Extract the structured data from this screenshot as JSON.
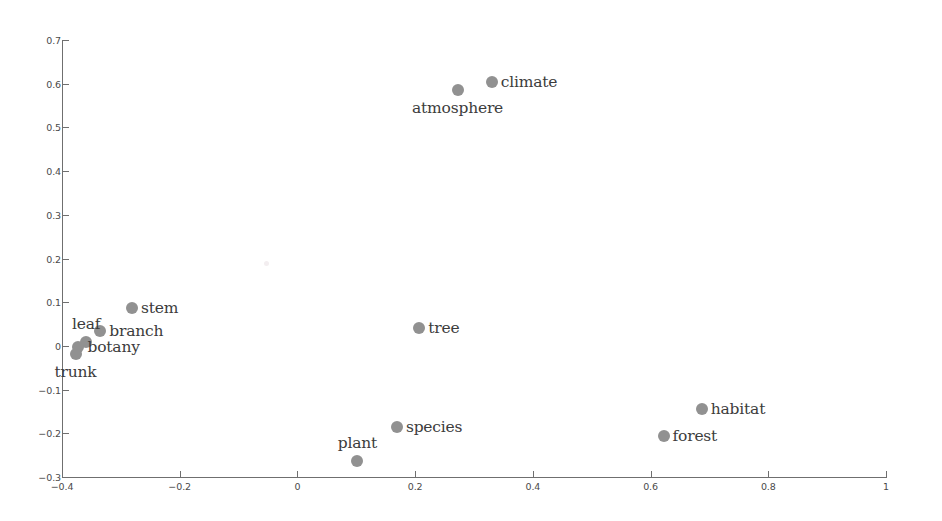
{
  "chart_data": {
    "type": "scatter",
    "title": "",
    "subtitle": "",
    "xlabel": "",
    "ylabel": "",
    "xlim": [
      -0.4,
      1.0
    ],
    "ylim": [
      -0.3,
      0.7
    ],
    "xticks": [
      -0.4,
      -0.2,
      0,
      0.2,
      0.4,
      0.6,
      0.8,
      1
    ],
    "yticks": [
      -0.3,
      -0.2,
      -0.1,
      0,
      0.1,
      0.2,
      0.3,
      0.4,
      0.5,
      0.6,
      0.7
    ],
    "xticklabels": [
      "−0.4",
      "−0.2",
      "0",
      "0.2",
      "0.4",
      "0.6",
      "0.8",
      "1"
    ],
    "yticklabels": [
      "−0.3",
      "−0.2",
      "−0.1",
      "0",
      "0.1",
      "0.2",
      "0.3",
      "0.4",
      "0.5",
      "0.6",
      "0.7"
    ],
    "grid": false,
    "legend": null,
    "marker_color": "#919191",
    "marker_size": 12,
    "axis_color": "#6f6f6f",
    "background_color": "#ffffff",
    "points": [
      {
        "label": "climate",
        "x": 0.33,
        "y": 0.605,
        "label_pos": "right"
      },
      {
        "label": "atmosphere",
        "x": 0.272,
        "y": 0.585,
        "label_pos": "below"
      },
      {
        "label": "stem",
        "x": -0.281,
        "y": 0.086,
        "label_pos": "right"
      },
      {
        "label": "branch",
        "x": -0.335,
        "y": 0.033,
        "label_pos": "right"
      },
      {
        "label": "leaf",
        "x": -0.359,
        "y": 0.01,
        "label_pos": "above"
      },
      {
        "label": "botany",
        "x": -0.372,
        "y": -0.002,
        "label_pos": "right"
      },
      {
        "label": "trunk",
        "x": -0.377,
        "y": -0.018,
        "label_pos": "below"
      },
      {
        "label": "tree",
        "x": 0.207,
        "y": 0.041,
        "label_pos": "right"
      },
      {
        "label": "species",
        "x": 0.169,
        "y": -0.186,
        "label_pos": "right"
      },
      {
        "label": "plant",
        "x": 0.102,
        "y": -0.263,
        "label_pos": "above"
      },
      {
        "label": "habitat",
        "x": 0.687,
        "y": -0.145,
        "label_pos": "right"
      },
      {
        "label": "forest",
        "x": 0.622,
        "y": -0.207,
        "label_pos": "right"
      }
    ]
  }
}
